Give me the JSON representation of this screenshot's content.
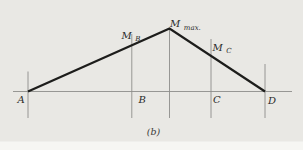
{
  "caption": "(b)",
  "axis_points": {
    "A": "A",
    "B": "B",
    "C": "C",
    "D": "D"
  },
  "moment_labels": {
    "mb": {
      "base": "M",
      "sub": "B"
    },
    "mmax": {
      "base": "M",
      "sub": "max."
    },
    "mc": {
      "base": "M",
      "sub": "C"
    }
  },
  "colors": {
    "paper": "#e9e8e4",
    "bottom_strip": "#f6f6f3",
    "moment_line": "#1d1d1b",
    "reference_line": "#8d8d8a",
    "text": "#2b2b29"
  },
  "diagram": {
    "type": "bending-moment-diagram",
    "shape": "triangular",
    "peak_at": "between B and C",
    "ordinates": [
      "M_B at B",
      "M_max at peak",
      "M_C at C"
    ],
    "baseline_points": [
      "A",
      "B",
      "C",
      "D"
    ]
  }
}
